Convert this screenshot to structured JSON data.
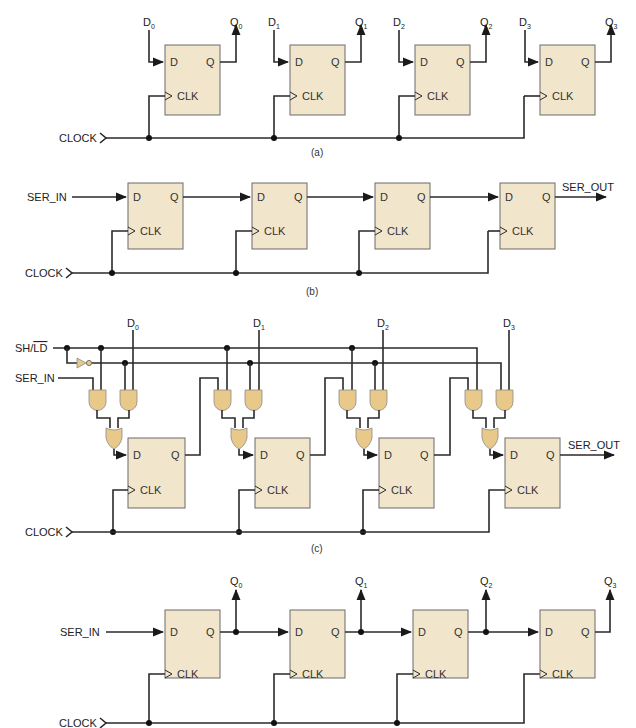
{
  "figure": {
    "colors": {
      "flipflop_fill": "#f1e6cc",
      "gate_fill": "#e8c98a",
      "wire": "#2a2a2a",
      "background": "#ffffff"
    },
    "pins": {
      "d": "D",
      "q": "Q",
      "clk": "CLK"
    },
    "panel_a": {
      "caption": "(a)",
      "clock_label": "CLOCK",
      "inputs": [
        "D",
        "D",
        "D",
        "D"
      ],
      "input_subs": [
        "0",
        "1",
        "2",
        "3"
      ],
      "outputs": [
        "Q",
        "Q",
        "Q",
        "Q"
      ],
      "output_subs": [
        "0",
        "1",
        "2",
        "3"
      ]
    },
    "panel_b": {
      "caption": "(b)",
      "clock_label": "CLOCK",
      "serial_in_label": "SER_IN",
      "serial_out_label": "SER_OUT"
    },
    "panel_c": {
      "caption": "(c)",
      "clock_label": "CLOCK",
      "serial_in_label": "SER_IN",
      "serial_out_label": "SER_OUT",
      "mode_label_sh": "SH/",
      "mode_label_ld": "LD",
      "inputs": [
        "D",
        "D",
        "D",
        "D"
      ],
      "input_subs": [
        "0",
        "1",
        "2",
        "3"
      ]
    },
    "panel_d": {
      "caption": "(d)",
      "clock_label": "CLOCK",
      "serial_in_label": "SER_IN",
      "outputs": [
        "Q",
        "Q",
        "Q",
        "Q"
      ],
      "output_subs": [
        "0",
        "1",
        "2",
        "3"
      ]
    }
  }
}
